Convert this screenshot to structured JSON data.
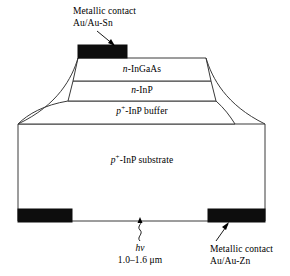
{
  "figure": {
    "background_color": "#ffffff",
    "line_color": "#3a3a3a",
    "contact_fill": "#0d0d0d"
  },
  "annotations": {
    "top_contact": {
      "line1": "Metallic contact",
      "line2": "Au/Au-Sn"
    },
    "bottom_contact": {
      "line1": "Metallic contact",
      "line2": "Au/Au-Zn"
    },
    "photon": {
      "symbol_h": "h",
      "symbol_nu": "ν",
      "wavelength": "1.0–1.6 μm"
    }
  },
  "layers": [
    {
      "id": "ingaas",
      "doping": "n",
      "superscript": "",
      "material": "-InGaAs"
    },
    {
      "id": "inp",
      "doping": "n",
      "superscript": "",
      "material": "-InP"
    },
    {
      "id": "buffer",
      "doping": "p",
      "superscript": "+",
      "material": "-InP buffer"
    },
    {
      "id": "substrate",
      "doping": "p",
      "superscript": "+",
      "material": "-InP substrate"
    }
  ]
}
